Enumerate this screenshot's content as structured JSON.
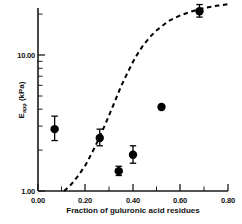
{
  "chart_data": {
    "type": "scatter",
    "title": "",
    "xlabel": "Fraction of guluronic acid residues",
    "ylabel": "E_app (kPa)",
    "ylabel_base": "E",
    "ylabel_sub": "app",
    "ylabel_units": " (kPa)",
    "xlim": [
      0.0,
      0.8
    ],
    "ylim": [
      1.0,
      30.0
    ],
    "yscale": "log",
    "xscale": "linear",
    "grid": false,
    "legend": false,
    "xticks": [
      "0.00",
      "0.20",
      "0.40",
      "0.60",
      "0.80"
    ],
    "xtick_values": [
      0.0,
      0.2,
      0.4,
      0.6,
      0.8
    ],
    "yticks": [
      "1.00",
      "10.00"
    ],
    "ytick_values": [
      1.0,
      10.0
    ],
    "marker": "filled-circle",
    "marker_color": "#000000",
    "series": [
      {
        "name": "E_app measurements",
        "points": [
          {
            "x": 0.07,
            "y": 2.85,
            "yerr_low": 2.35,
            "yerr_high": 3.55
          },
          {
            "x": 0.26,
            "y": 2.45,
            "yerr_low": 2.15,
            "yerr_high": 2.85
          },
          {
            "x": 0.34,
            "y": 1.4,
            "yerr_low": 1.3,
            "yerr_high": 1.52
          },
          {
            "x": 0.4,
            "y": 1.85,
            "yerr_low": 1.6,
            "yerr_high": 2.15
          },
          {
            "x": 0.52,
            "y": 4.15,
            "yerr_low": 4.15,
            "yerr_high": 4.15
          },
          {
            "x": 0.68,
            "y": 21.0,
            "yerr_low": 19.0,
            "yerr_high": 23.5
          }
        ]
      }
    ],
    "fit_curve": {
      "name": "sigmoidal model fit",
      "style": "dashed",
      "color": "#000000",
      "x": [
        0.11,
        0.14,
        0.17,
        0.2,
        0.23,
        0.26,
        0.29,
        0.32,
        0.35,
        0.38,
        0.41,
        0.44,
        0.47,
        0.5,
        0.55,
        0.6,
        0.65,
        0.7,
        0.75,
        0.8
      ],
      "y": [
        1.0,
        1.12,
        1.3,
        1.55,
        1.95,
        2.5,
        3.3,
        4.4,
        5.9,
        7.6,
        9.6,
        11.6,
        13.5,
        15.2,
        17.8,
        19.6,
        21.0,
        22.2,
        23.0,
        23.6
      ]
    },
    "annotations": []
  }
}
